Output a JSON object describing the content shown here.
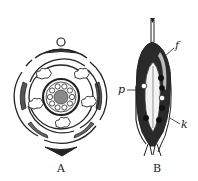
{
  "figure": {
    "panels": [
      {
        "id": "A",
        "label": "A",
        "description": "Floral diagram (transverse section)"
      },
      {
        "id": "B",
        "label": "B",
        "description": "Longitudinal section of fruit/ovary"
      }
    ],
    "annotations": {
      "f": "f",
      "p": "p",
      "k": "k"
    },
    "colors": {
      "ink": "#222222",
      "gray": "#8a8a8a",
      "background": "#ffffff"
    }
  }
}
